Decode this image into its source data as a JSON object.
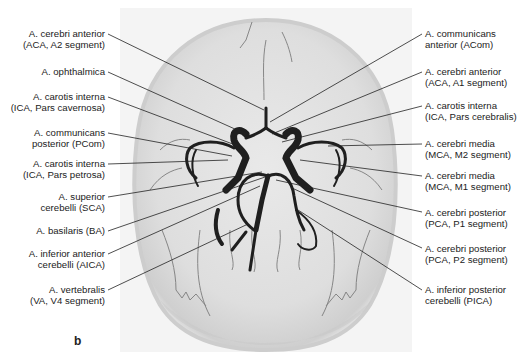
{
  "figure": {
    "panel_letter": "b",
    "colors": {
      "background": "#ffffff",
      "skull_fill": "#e4e4e4",
      "skull_edge": "#c6c6c6",
      "vessel": "#1f1f1f",
      "leader_line": "#222222",
      "text": "#222222"
    },
    "left_labels": [
      {
        "line1": "A. cerebri anterior",
        "line2": "(ACA, A2 segment)"
      },
      {
        "line1": "A. ophthalmica",
        "line2": ""
      },
      {
        "line1": "A. carotis interna",
        "line2": "(ICA, Pars cavernosa)"
      },
      {
        "line1": "A. communicans",
        "line2": "posterior (PCom)"
      },
      {
        "line1": "A. carotis interna",
        "line2": "(ICA, Pars petrosa)"
      },
      {
        "line1": "A. superior",
        "line2": "cerebelli (SCA)"
      },
      {
        "line1": "A. basilaris (BA)",
        "line2": ""
      },
      {
        "line1": "A. inferior anterior",
        "line2": "cerebelli (AICA)"
      },
      {
        "line1": "A. vertebralis",
        "line2": "(VA, V4 segment)"
      }
    ],
    "right_labels": [
      {
        "line1": "A. communicans",
        "line2": "anterior (ACom)"
      },
      {
        "line1": "A. cerebri anterior",
        "line2": "(ACA, A1 segment)"
      },
      {
        "line1": "A. carotis interna",
        "line2": "(ICA, Pars cerebralis)"
      },
      {
        "line1": "A. cerebri media",
        "line2": "(MCA, M2 segment)"
      },
      {
        "line1": "A. cerebri media",
        "line2": "(MCA, M1 segment)"
      },
      {
        "line1": "A. cerebri posterior",
        "line2": "(PCA, P1 segment)"
      },
      {
        "line1": "A. cerebri posterior",
        "line2": "(PCA, P2 segment)"
      },
      {
        "line1": "A. inferior posterior",
        "line2": "cerebelli (PICA)"
      }
    ]
  }
}
